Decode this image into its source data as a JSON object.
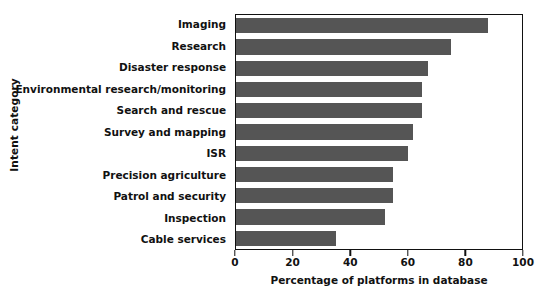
{
  "chart_data": {
    "type": "bar",
    "orientation": "horizontal",
    "title": "",
    "xlabel": "Percentage of platforms in database",
    "ylabel": "Intent category",
    "xlim": [
      0,
      100
    ],
    "xticks": [
      0,
      20,
      40,
      60,
      80,
      100
    ],
    "xtick_labels": [
      "0",
      "20",
      "40",
      "60",
      "80",
      "100"
    ],
    "grid": false,
    "legend": false,
    "bar_color": "#555555",
    "axis_color": "#111111",
    "background": "#ffffff",
    "categories": [
      "Imaging",
      "Research",
      "Disaster response",
      "Environmental research/monitoring",
      "Search and rescue",
      "Survey and mapping",
      "ISR",
      "Precision agriculture",
      "Patrol and security",
      "Inspection",
      "Cable services"
    ],
    "values": [
      88,
      75,
      67,
      65,
      65,
      62,
      60,
      55,
      55,
      52,
      35
    ]
  }
}
